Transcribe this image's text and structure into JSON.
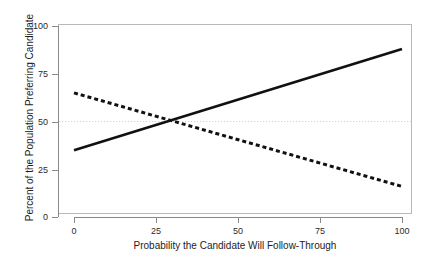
{
  "chart_data": {
    "type": "line",
    "title": "",
    "xlabel": "Probability the Candidate Will Follow-Through",
    "ylabel": "Percent of the Population Preferring Candidate",
    "xlim": [
      0,
      100
    ],
    "ylim": [
      0,
      100
    ],
    "xticks": [
      0,
      25,
      50,
      75,
      100
    ],
    "yticks": [
      0,
      25,
      50,
      75,
      100
    ],
    "xtick_labels": [
      "0",
      "25",
      "50",
      "75",
      "100"
    ],
    "ytick_labels": [
      "0",
      "25",
      "50",
      "75",
      "100"
    ],
    "grid": false,
    "legend": "none",
    "series": [
      {
        "name": "Rising candidate preference",
        "style": "solid",
        "color": "#111111",
        "width": 2.6,
        "x": [
          0,
          100
        ],
        "values": [
          35,
          88
        ]
      },
      {
        "name": "Declining candidate preference",
        "style": "dashed",
        "color": "#111111",
        "width": 3.0,
        "dash_pattern": "4,3",
        "x": [
          0,
          100
        ],
        "values": [
          65,
          16
        ]
      }
    ],
    "reference_lines": [
      {
        "name": "fifty-percent-reference",
        "orientation": "horizontal",
        "value": 50,
        "style": "dotted",
        "color": "#d2d2d2"
      }
    ],
    "annotations": [
      {
        "name": "crossover-point",
        "x": 29,
        "y": 50,
        "label": ""
      }
    ]
  }
}
